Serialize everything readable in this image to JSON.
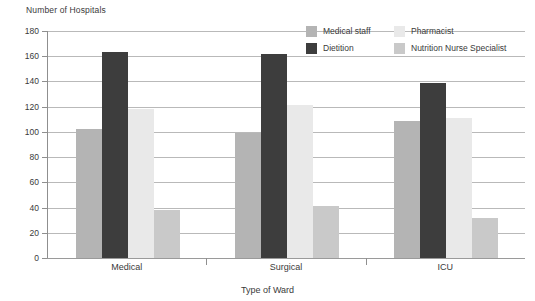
{
  "chart_data": {
    "type": "bar",
    "title": "",
    "xlabel": "Type of Ward",
    "ylabel": "Number of Hospitals",
    "categories": [
      "Medical",
      "Surgical",
      "ICU"
    ],
    "series": [
      {
        "name": "Medical staff",
        "color": "#b4b4b4",
        "values": [
          102,
          99,
          109
        ]
      },
      {
        "name": "Dietition",
        "color": "#3d3d3d",
        "values": [
          163,
          162,
          139
        ]
      },
      {
        "name": "Pharmacist",
        "color": "#e9e9e9",
        "values": [
          118,
          121,
          111
        ]
      },
      {
        "name": "Nutrition Nurse Specialist",
        "color": "#c9c9c9",
        "values": [
          38,
          41,
          32
        ]
      }
    ],
    "ylim": [
      0,
      180
    ],
    "yticks": [
      0,
      20,
      40,
      60,
      80,
      100,
      120,
      140,
      160,
      180
    ],
    "ytick_labels": [
      "0",
      "20",
      "40",
      "60",
      "80",
      "100",
      "120",
      "140",
      "160",
      "180"
    ],
    "grid": true,
    "legend_position": "top-right",
    "legend_layout": "2-columns"
  },
  "axes": {
    "y_title": "Number of Hospitals",
    "x_title": "Type of Ward"
  },
  "legend": {
    "entries": [
      {
        "label": "Medical staff",
        "swatch": "#b4b4b4"
      },
      {
        "label": "Pharmacist",
        "swatch": "#e9e9e9"
      },
      {
        "label": "Dietition",
        "swatch": "#3d3d3d"
      },
      {
        "label": "Nutrition Nurse Specialist",
        "swatch": "#c9c9c9"
      }
    ]
  }
}
